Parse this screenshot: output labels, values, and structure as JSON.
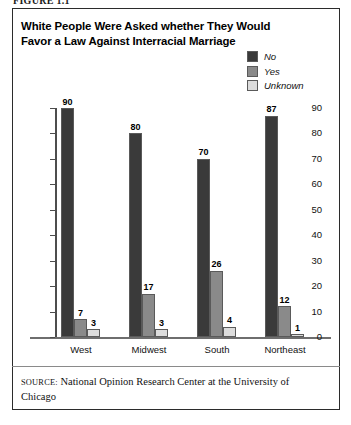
{
  "figure_label": "FIGURE 1.1",
  "chart_title": "White People Were Asked whether They Would Favor a Law Against Interracial Marriage",
  "source": {
    "prefix": "SOURCE:",
    "text": " National Opinion Research Center at the University of Chicago"
  },
  "colors": {
    "no": "#3a3a3a",
    "yes": "#8a8a8a",
    "unknown": "#dcdcdc",
    "axis": "#4d4d4d",
    "border": "#2b2b2b"
  },
  "chart_data": {
    "type": "bar",
    "title": "White People Were Asked whether They Would Favor a Law Against Interracial Marriage",
    "xlabel": "",
    "ylabel": "",
    "ylim": [
      0,
      90
    ],
    "yticks": [
      0,
      10,
      20,
      30,
      40,
      50,
      60,
      70,
      80,
      90
    ],
    "grid": false,
    "legend_position": "top-right",
    "categories": [
      "West",
      "Midwest",
      "South",
      "Northeast"
    ],
    "series": [
      {
        "name": "No",
        "color": "#3a3a3a",
        "values": [
          90,
          80,
          70,
          87
        ]
      },
      {
        "name": "Yes",
        "color": "#8a8a8a",
        "values": [
          7,
          17,
          26,
          12
        ]
      },
      {
        "name": "Unknown",
        "color": "#dcdcdc",
        "values": [
          3,
          3,
          4,
          1
        ]
      }
    ]
  }
}
